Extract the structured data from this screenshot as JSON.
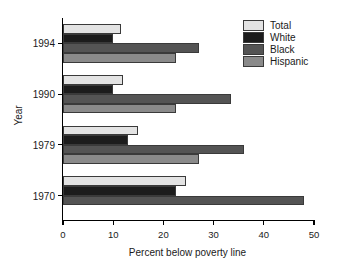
{
  "chart_data": {
    "type": "bar",
    "orientation": "horizontal",
    "title": "",
    "xlabel": "Percent below poverty line",
    "ylabel": "Year",
    "categories": [
      "1994",
      "1990",
      "1979",
      "1970"
    ],
    "series": [
      {
        "name": "Total",
        "color": "#e3e3e3",
        "values": [
          11.5,
          12.0,
          15.0,
          24.5
        ]
      },
      {
        "name": "White",
        "color": "#1c1c1c",
        "values": [
          10.0,
          10.0,
          13.0,
          22.5
        ]
      },
      {
        "name": "Black",
        "color": "#545454",
        "values": [
          27.0,
          33.5,
          36.0,
          48.0
        ]
      },
      {
        "name": "Hispanic",
        "color": "#8a8a8a",
        "values": [
          22.5,
          22.5,
          27.0,
          null
        ]
      }
    ],
    "xlim": [
      0,
      50
    ],
    "xticks": [
      0,
      10,
      20,
      30,
      40,
      50
    ],
    "xtick_labels": [
      "0",
      "10",
      "20",
      "30",
      "40",
      "50"
    ],
    "grid": false,
    "legend_position": "top-right",
    "legend_entries": [
      "Total",
      "White",
      "Black",
      "Hispanic"
    ]
  }
}
